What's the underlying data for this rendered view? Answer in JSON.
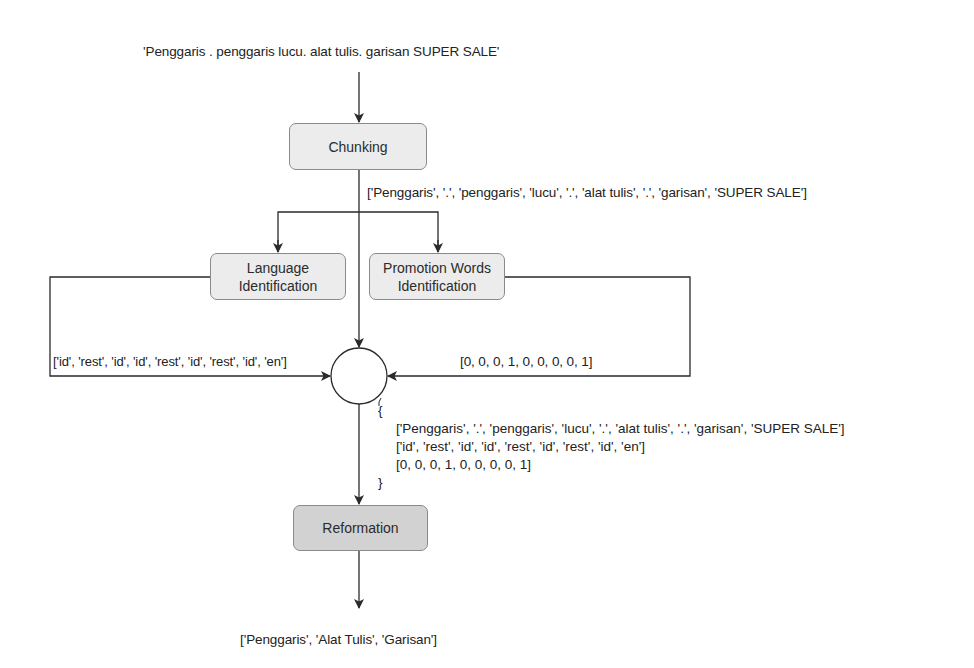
{
  "input_text": "'Penggaris . penggaris lucu. alat tulis. garisan SUPER SALE'",
  "nodes": {
    "chunking": "Chunking",
    "language_identification": [
      "Language",
      "Identification"
    ],
    "promotion_words_identification": [
      "Promotion Words",
      "Identification"
    ],
    "merge": "",
    "reformation": "Reformation"
  },
  "edges": {
    "chunking_output": "['Penggaris', '.', 'penggaris', 'lucu', '.', 'alat tulis', '.', 'garisan', 'SUPER SALE']",
    "language_output": "['id', 'rest', 'id', 'id', 'rest', 'id', 'rest', 'id', 'en']",
    "promotion_output": "[0, 0, 0, 1, 0, 0, 0, 0, 1]"
  },
  "merged": {
    "open": "{",
    "lines": [
      "['Penggaris', '.', 'penggaris', 'lucu', '.', 'alat tulis', '.', 'garisan', 'SUPER SALE']",
      "['id', 'rest', 'id', 'id', 'rest', 'id', 'rest', 'id', 'en']",
      "[0, 0, 0, 1, 0, 0, 0, 0, 1]"
    ],
    "close": "}"
  },
  "output_text": "['Penggaris', 'Alat Tulis', 'Garisan']",
  "colors": {
    "box_light": "#ececec",
    "box_dark": "#d2d2d2",
    "line": "#2a2a2a"
  }
}
